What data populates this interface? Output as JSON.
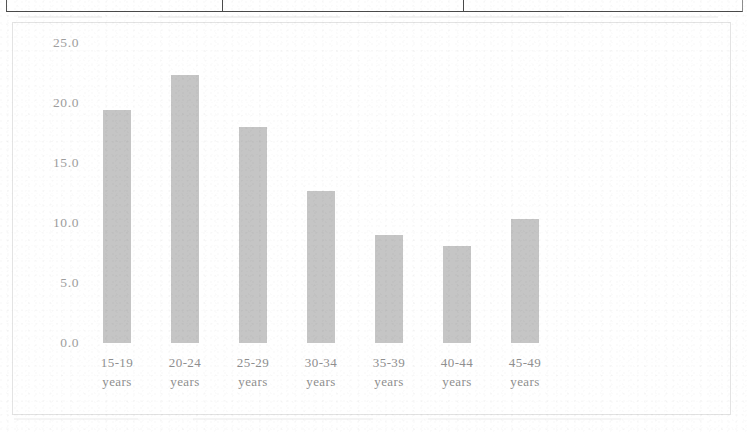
{
  "page": {
    "table_fragment": {
      "name": "table-bottom-border-fragment",
      "column_divider_count": 2
    }
  },
  "chart_data": {
    "type": "bar",
    "title": "",
    "subtitle": "",
    "xlabel": "",
    "ylabel": "",
    "categories": [
      "15-19 years",
      "20-24 years",
      "25-29 years",
      "30-34 years",
      "35-39 years",
      "40-44 years",
      "45-49 years"
    ],
    "category_lines": [
      [
        "15-19",
        "years"
      ],
      [
        "20-24",
        "years"
      ],
      [
        "25-29",
        "years"
      ],
      [
        "30-34",
        "years"
      ],
      [
        "35-39",
        "years"
      ],
      [
        "40-44",
        "years"
      ],
      [
        "45-49",
        "years"
      ]
    ],
    "values": [
      19.4,
      22.3,
      18.0,
      12.7,
      9.0,
      8.1,
      10.3
    ],
    "ylim": [
      0.0,
      25.0
    ],
    "ytick_values": [
      25.0,
      20.0,
      15.0,
      10.0,
      5.0,
      0.0
    ],
    "ytick_labels": [
      "25.0",
      "20.0",
      "15.0",
      "10.0",
      "5.0",
      "0.0"
    ],
    "grid": false,
    "legend": null,
    "bar_color": "#bdbdbd",
    "text_color": "#909090",
    "frame_color": "#e3e3e3"
  }
}
